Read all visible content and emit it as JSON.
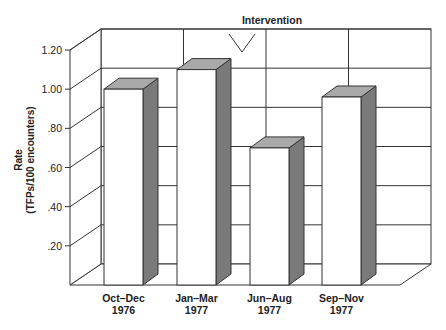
{
  "chart_data": {
    "type": "bar",
    "title": "",
    "annotation": "Intervention",
    "annotation_position": "between Jan–Mar 1977 and Jun–Aug 1977",
    "xlabel": "",
    "ylabel": "Rate (TFPs/100 encounters)",
    "ylabel_lines": [
      "Rate",
      "(TFPs/100 encounters)"
    ],
    "categories": [
      [
        "Oct–Dec",
        "1976"
      ],
      [
        "Jan–Mar",
        "1977"
      ],
      [
        "Jun–Aug",
        "1977"
      ],
      [
        "Sep–Nov",
        "1977"
      ]
    ],
    "category_labels": [
      "Oct–Dec 1976",
      "Jan–Mar 1977",
      "Jun–Aug 1977",
      "Sep–Nov 1977"
    ],
    "values": [
      1.0,
      1.1,
      0.7,
      0.96
    ],
    "yticks": [
      0.2,
      0.4,
      0.6,
      0.8,
      1.0,
      1.2
    ],
    "ytick_labels": [
      ".20",
      ".40",
      ".60",
      ".80",
      "1.00",
      "1.20"
    ],
    "ylim": [
      0,
      1.2
    ],
    "grid": true,
    "style": "3d",
    "colors": {
      "bar_front": "#ffffff",
      "bar_side": "#7a7a7a",
      "bar_top": "#a9a9a9",
      "line": "#333333"
    }
  }
}
